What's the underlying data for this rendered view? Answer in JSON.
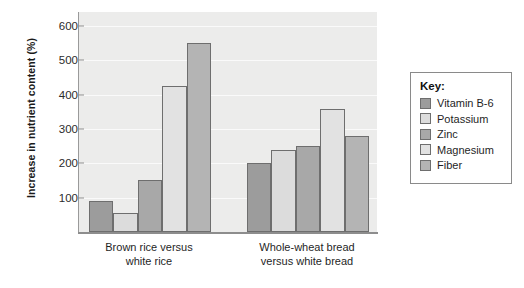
{
  "chart_data": {
    "type": "bar",
    "title": "",
    "xlabel": "",
    "ylabel": "Increase in nutrient content (%)",
    "categories": [
      "Brown rice versus white rice",
      "Whole-wheat bread versus white bread"
    ],
    "category_lines": [
      [
        "Brown rice versus",
        "white rice"
      ],
      [
        "Whole-wheat bread",
        "versus white bread"
      ]
    ],
    "series": [
      {
        "name": "Vitamin B-6",
        "color": "#9c9c9c",
        "values": [
          90,
          200
        ]
      },
      {
        "name": "Potassium",
        "color": "#dcdcdc",
        "values": [
          55,
          240
        ]
      },
      {
        "name": "Zinc",
        "color": "#a8a8a8",
        "values": [
          150,
          250
        ]
      },
      {
        "name": "Magnesium",
        "color": "#e2e2e2",
        "values": [
          425,
          357
        ]
      },
      {
        "name": "Fiber",
        "color": "#b4b4b4",
        "values": [
          550,
          278
        ]
      }
    ],
    "ylim": [
      0,
      640
    ],
    "yticks": [
      100,
      200,
      300,
      400,
      500,
      600
    ],
    "ytick_labels": [
      "100",
      "200",
      "300",
      "400",
      "500",
      "600"
    ],
    "grid": true,
    "legend_position": "right",
    "plot_background": "#ececeb"
  },
  "legend": {
    "title": "Key:"
  }
}
